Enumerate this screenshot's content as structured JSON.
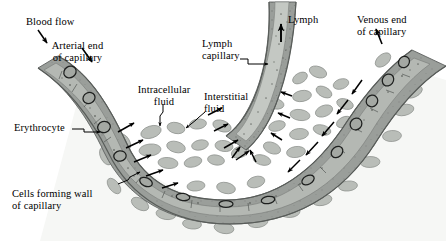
{
  "figure": {
    "background_color": "#ffffff"
  },
  "colors": {
    "vessel_wall_dark": "#6f7370",
    "vessel_wall_mid": "#8f938f",
    "vessel_lumen": "#a9ada9",
    "tissue_cell": "#b9bdb8",
    "tissue_cell_stroke": "#8a8e8a",
    "lymph_lumen": "#b2b6b2",
    "arrow_black": "#000000",
    "text_black": "#000000",
    "interstitial_space": "#f4f5f3"
  },
  "labels": {
    "blood_flow": "Blood flow",
    "arterial_end": "Arterial end\nof capillary",
    "erythrocyte": "Erythrocyte",
    "cells_forming_wall": "Cells forming wall\nof capillary",
    "intracellular_fluid": "Intracellular\nfluid",
    "interstitial_fluid": "Interstitial\nfluid",
    "lymph_capillary": "Lymph\ncapillary",
    "lymph": "Lymph",
    "venous_end": "Venous end\nof capillary"
  },
  "structures": [
    {
      "name": "arterial-capillary-limb",
      "description": "Capillary descending from upper left"
    },
    {
      "name": "capillary-bend",
      "description": "U-shaped bend of capillary at bottom center"
    },
    {
      "name": "venous-capillary-limb",
      "description": "Capillary ascending to upper right"
    },
    {
      "name": "lymph-capillary-vessel",
      "description": "Blind-ended lymph capillary descending from top center"
    },
    {
      "name": "tissue-cells",
      "description": "Interstitial tissue cells surrounding vessels"
    },
    {
      "name": "erythrocytes",
      "description": "Red blood cells inside capillary lumen"
    },
    {
      "name": "exchange-arrows",
      "description": "Black arrows showing fluid movement across capillary wall"
    }
  ]
}
